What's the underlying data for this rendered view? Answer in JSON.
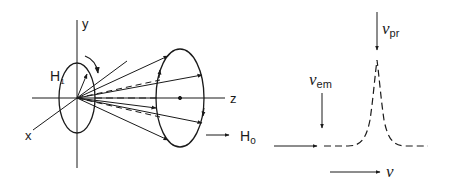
{
  "left_diagram": {
    "axes": {
      "y_label": "y",
      "x_label": "x",
      "z_label": "z"
    },
    "field_labels": {
      "h1_main": "H",
      "h1_sub": "1",
      "h0_main": "H",
      "h0_sub": "o"
    },
    "description": "Spin precession cone: rotating field H1 in small loop at origin, magnetization vectors precessing around z axis toward larger loop, static field H0 along z"
  },
  "right_diagram": {
    "labels": {
      "nu_pr_main": "ν",
      "nu_pr_sub": "pr",
      "nu_em_main": "ν",
      "nu_em_sub": "em",
      "nu_axis": "ν"
    },
    "description": "Dashed resonance line profile with sharp peak at ν_pr; arrow marking ν_em on baseline; frequency axis arrow ν"
  },
  "colors": {
    "line": "#1a1a1a",
    "background": "#ffffff"
  }
}
